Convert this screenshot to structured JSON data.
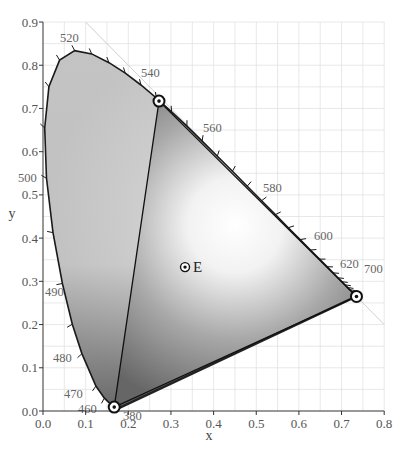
{
  "chart_data": {
    "type": "scatter",
    "title": "",
    "subtitle": "CIE 1931 chromaticity diagram with RGB gamut triangle",
    "xlabel": "x",
    "ylabel": "y",
    "xlim": [
      0.0,
      0.8
    ],
    "ylim": [
      0.0,
      0.9
    ],
    "grid": true,
    "x_ticks": [
      "0.0",
      "0.1",
      "0.2",
      "0.3",
      "0.4",
      "0.5",
      "0.6",
      "0.7",
      "0.8"
    ],
    "y_ticks": [
      "0.0",
      "0.1",
      "0.2",
      "0.3",
      "0.4",
      "0.5",
      "0.6",
      "0.7",
      "0.8",
      "0.9"
    ],
    "spectral_locus_labels": [
      {
        "nm": "380",
        "x": 0.174,
        "y": 0.005
      },
      {
        "nm": "460",
        "x": 0.144,
        "y": 0.03
      },
      {
        "nm": "470",
        "x": 0.124,
        "y": 0.058
      },
      {
        "nm": "480",
        "x": 0.091,
        "y": 0.133
      },
      {
        "nm": "490",
        "x": 0.045,
        "y": 0.295
      },
      {
        "nm": "500",
        "x": 0.008,
        "y": 0.538
      },
      {
        "nm": "520",
        "x": 0.074,
        "y": 0.834
      },
      {
        "nm": "540",
        "x": 0.23,
        "y": 0.754
      },
      {
        "nm": "560",
        "x": 0.373,
        "y": 0.624
      },
      {
        "nm": "580",
        "x": 0.512,
        "y": 0.487
      },
      {
        "nm": "600",
        "x": 0.627,
        "y": 0.373
      },
      {
        "nm": "620",
        "x": 0.691,
        "y": 0.308
      },
      {
        "nm": "700",
        "x": 0.735,
        "y": 0.265
      }
    ],
    "series": [
      {
        "name": "Gamut primaries",
        "points": [
          {
            "label": "Green primary",
            "x": 0.272,
            "y": 0.717
          },
          {
            "label": "Red primary",
            "x": 0.735,
            "y": 0.265
          },
          {
            "label": "Blue primary",
            "x": 0.167,
            "y": 0.009
          }
        ]
      },
      {
        "name": "White point",
        "points": [
          {
            "label": "E",
            "x": 0.333,
            "y": 0.333
          }
        ]
      }
    ]
  },
  "labels": {
    "x_axis": "x",
    "y_axis": "y",
    "white_point": "E"
  }
}
